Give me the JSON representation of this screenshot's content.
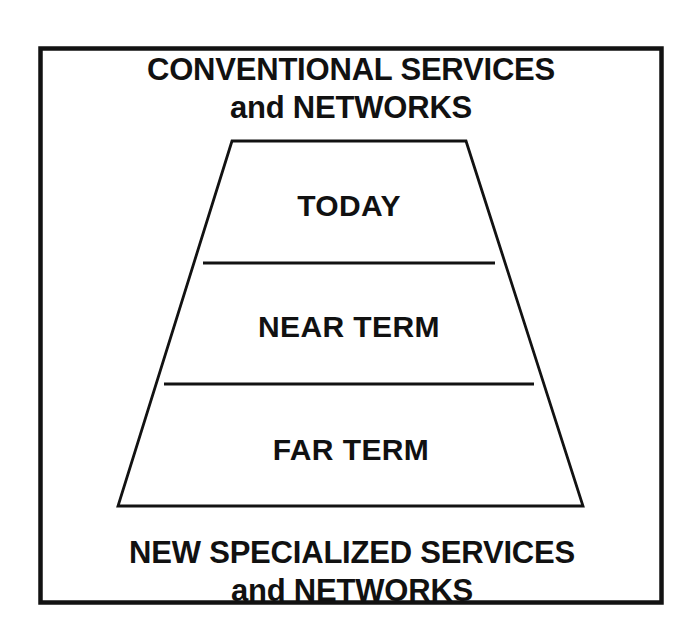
{
  "figure": {
    "title_top": {
      "line1": "CONVENTIONAL SERVICES",
      "line2": "and NETWORKS"
    },
    "title_bottom": {
      "line1": "NEW SPECIALIZED SERVICES",
      "line2": "and NETWORKS"
    },
    "bands": [
      {
        "label": "TODAY"
      },
      {
        "label": "NEAR TERM"
      },
      {
        "label": "FAR TERM"
      }
    ],
    "colors": {
      "ink": "#121212",
      "paper": "#ffffff"
    }
  }
}
